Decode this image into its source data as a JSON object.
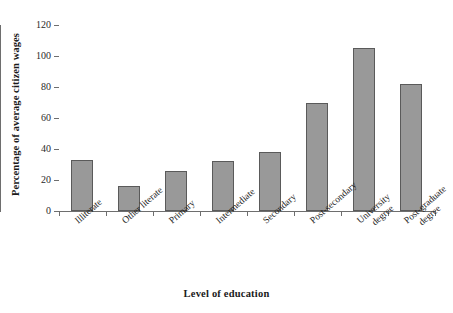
{
  "chart_data": {
    "type": "bar",
    "title": "",
    "subtitle": "",
    "xlabel": "Level of education",
    "ylabel": "Percentage of average citizen wages",
    "categories": [
      "Illiterate",
      "Other literate",
      "Primary",
      "Intermediate",
      "Secondary",
      "Post-secondary",
      "University degree",
      "Post-graduate degree"
    ],
    "category_lines": [
      [
        "Illiterate"
      ],
      [
        "Other literate"
      ],
      [
        "Primary"
      ],
      [
        "Intermediate"
      ],
      [
        "Secondary"
      ],
      [
        "Post-secondary"
      ],
      [
        "University",
        "degree"
      ],
      [
        "Post-graduate",
        "degree"
      ]
    ],
    "values": [
      33,
      16,
      26,
      32,
      38,
      70,
      105,
      82
    ],
    "ylim": [
      0,
      120
    ],
    "yticks": [
      0,
      20,
      40,
      60,
      80,
      100,
      120
    ],
    "ytick_labels": [
      "0",
      "20",
      "40",
      "60",
      "80",
      "100",
      "120"
    ],
    "grid": false,
    "legend": null,
    "bar_color": "#999999",
    "bar_edge_color": "#5a5a5a",
    "axis_color": "#6e6e6e",
    "background_color": "#ffffff"
  }
}
